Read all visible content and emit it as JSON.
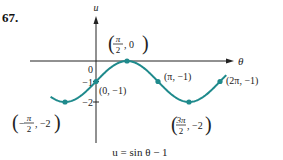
{
  "problem_number": "67.",
  "chart_data": {
    "type": "line",
    "title": "u = sin θ − 1",
    "xlabel": "θ",
    "ylabel": "u",
    "function": "sin(theta) - 1",
    "x_range": [
      -2.3,
      6.6
    ],
    "ylim": [
      -2.6,
      1.6
    ],
    "grid": false,
    "y_ticks": [
      {
        "value": 0,
        "label": "0"
      },
      {
        "value": -1,
        "label": "−1"
      },
      {
        "value": -2,
        "label": "−2"
      }
    ],
    "points": [
      {
        "x": 1.5708,
        "y": 0,
        "label_num": "π",
        "label_den": "2",
        "label_y": "0",
        "frac": true,
        "neg": false
      },
      {
        "x": 0,
        "y": -1,
        "label": "(0, −1)",
        "frac": false
      },
      {
        "x": -1.5708,
        "y": -2,
        "label_num": "π",
        "label_den": "2",
        "label_y": "−2",
        "frac": true,
        "neg": true
      },
      {
        "x": 3.1416,
        "y": -1,
        "label": "(π, −1)",
        "frac": false
      },
      {
        "x": 4.7124,
        "y": -2,
        "label_num": "3π",
        "label_den": "2",
        "label_y": "−2",
        "frac": true,
        "neg": false
      },
      {
        "x": 6.2832,
        "y": -1,
        "label": "(2π, −1)",
        "frac": false
      }
    ],
    "colors": {
      "curve": "#1f8a8c",
      "axis": "#222222"
    }
  }
}
